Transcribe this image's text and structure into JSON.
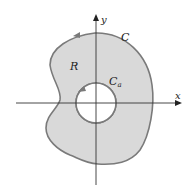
{
  "diagram": {
    "labels": {
      "x_axis": "x",
      "y_axis": "y",
      "outer_curve": "C",
      "region": "R",
      "inner_curve_main": "C",
      "inner_curve_sub": "a"
    },
    "colors": {
      "region_fill": "#d9d9d9",
      "curve_stroke": "#7a7a7a",
      "axis": "#333333",
      "background": "#ffffff"
    }
  }
}
